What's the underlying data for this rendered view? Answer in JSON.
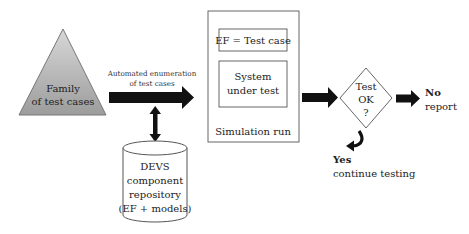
{
  "diagram": {
    "family": {
      "line1": "Family",
      "line2": "of test cases",
      "fill": "#b5b5b5"
    },
    "enumeration_label": {
      "line1": "Automated enumeration",
      "line2": "of test cases"
    },
    "repository": {
      "line1": "DEVS",
      "line2": "component",
      "line3": "repository",
      "line4": "(EF + models)"
    },
    "simulation": {
      "ef_box": "EF = Test case",
      "sut_line1": "System",
      "sut_line2": "under test",
      "caption": "Simulation run"
    },
    "decision": {
      "line1": "Test",
      "line2": "OK",
      "line3": "?"
    },
    "no_outcome": {
      "label": "No",
      "action": "report"
    },
    "yes_outcome": {
      "label": "Yes",
      "action": "continue testing"
    },
    "colors": {
      "arrow": "#111111",
      "stroke": "#555555",
      "triangle_top": "#d6d6d6",
      "triangle_bottom": "#9e9e9e"
    }
  }
}
